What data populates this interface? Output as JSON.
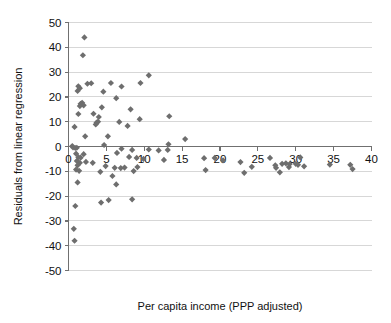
{
  "chart_data": {
    "type": "scatter",
    "title": "",
    "xlabel": "Per capita income (PPP adjusted)",
    "ylabel": "Residuals from linear regression",
    "xlim": [
      0,
      40
    ],
    "ylim": [
      -50,
      50
    ],
    "xticks": [
      0,
      5,
      10,
      15,
      20,
      25,
      30,
      35,
      40
    ],
    "xtick_labels": [
      "0",
      "5",
      "10",
      "15",
      "20",
      "25",
      "30",
      "35",
      "40"
    ],
    "yticks": [
      -50,
      -40,
      -30,
      -20,
      -10,
      0,
      10,
      20,
      30,
      40,
      50
    ],
    "ytick_labels": [
      "-50",
      "-40",
      "-30",
      "-20",
      "-10",
      "0",
      "10",
      "20",
      "30",
      "40",
      "50"
    ],
    "grid": "horizontal",
    "zero_line": true,
    "legend": "none",
    "marker": "diamond",
    "marker_color": "#6e6e6e",
    "series": [
      {
        "name": "Residuals",
        "points": [
          [
            2.1,
            44.0
          ],
          [
            1.9,
            36.8
          ],
          [
            10.6,
            28.7
          ],
          [
            9.5,
            25.6
          ],
          [
            1.3,
            24.3
          ],
          [
            1.5,
            23.5
          ],
          [
            1.2,
            22.4
          ],
          [
            2.5,
            25.3
          ],
          [
            3.0,
            25.5
          ],
          [
            5.6,
            25.6
          ],
          [
            7.0,
            24.2
          ],
          [
            4.6,
            22.1
          ],
          [
            6.3,
            19.5
          ],
          [
            1.8,
            17.6
          ],
          [
            1.6,
            17.2
          ],
          [
            2.0,
            16.6
          ],
          [
            1.5,
            16.3
          ],
          [
            4.4,
            15.8
          ],
          [
            8.2,
            15.0
          ],
          [
            1.3,
            13.1
          ],
          [
            3.3,
            13.2
          ],
          [
            13.3,
            12.2
          ],
          [
            4.0,
            11.9
          ],
          [
            9.4,
            11.0
          ],
          [
            3.9,
            10.0
          ],
          [
            6.7,
            9.9
          ],
          [
            3.7,
            9.6
          ],
          [
            3.6,
            8.9
          ],
          [
            0.8,
            7.9
          ],
          [
            7.8,
            8.3
          ],
          [
            15.4,
            3.0
          ],
          [
            2.2,
            4.1
          ],
          [
            5.2,
            4.1
          ],
          [
            4.7,
            0.6
          ],
          [
            13.2,
            0.9
          ],
          [
            0.5,
            0.2
          ],
          [
            0.6,
            -0.4
          ],
          [
            0.9,
            -0.6
          ],
          [
            1.1,
            -0.5
          ],
          [
            7.0,
            -0.9
          ],
          [
            8.4,
            -1.4
          ],
          [
            10.6,
            -1.2
          ],
          [
            11.9,
            -1.6
          ],
          [
            13.1,
            -1.4
          ],
          [
            6.4,
            -2.6
          ],
          [
            1.0,
            -2.9
          ],
          [
            2.0,
            -3.1
          ],
          [
            1.3,
            -4.3
          ],
          [
            1.6,
            -4.5
          ],
          [
            8.0,
            -4.2
          ],
          [
            9.0,
            -4.6
          ],
          [
            9.9,
            -5.0
          ],
          [
            12.6,
            -5.4
          ],
          [
            17.9,
            -4.7
          ],
          [
            19.3,
            -4.6
          ],
          [
            1.1,
            -5.8
          ],
          [
            2.3,
            -6.2
          ],
          [
            1.5,
            -6.6
          ],
          [
            3.2,
            -6.6
          ],
          [
            20.4,
            -5.6
          ],
          [
            22.7,
            -6.3
          ],
          [
            26.6,
            -4.6
          ],
          [
            30.6,
            -4.4
          ],
          [
            1.2,
            -7.6
          ],
          [
            4.9,
            -7.9
          ],
          [
            6.1,
            -8.6
          ],
          [
            6.9,
            -8.7
          ],
          [
            7.4,
            -8.5
          ],
          [
            9.1,
            -8.3
          ],
          [
            27.3,
            -7.6
          ],
          [
            28.2,
            -7.0
          ],
          [
            28.7,
            -6.8
          ],
          [
            29.2,
            -7.1
          ],
          [
            30.0,
            -7.0
          ],
          [
            30.3,
            -7.4
          ],
          [
            34.5,
            -7.3
          ],
          [
            37.2,
            -7.4
          ],
          [
            1.0,
            -9.3
          ],
          [
            1.4,
            -9.8
          ],
          [
            4.2,
            -10.2
          ],
          [
            8.6,
            -9.9
          ],
          [
            18.1,
            -9.5
          ],
          [
            24.2,
            -8.2
          ],
          [
            27.4,
            -8.6
          ],
          [
            29.1,
            -8.3
          ],
          [
            31.1,
            -8.0
          ],
          [
            37.5,
            -9.1
          ],
          [
            5.8,
            -11.9
          ],
          [
            23.2,
            -10.6
          ],
          [
            27.9,
            -10.4
          ],
          [
            1.2,
            -14.5
          ],
          [
            6.3,
            -15.3
          ],
          [
            4.3,
            -22.6
          ],
          [
            5.3,
            -21.6
          ],
          [
            8.4,
            -21.3
          ],
          [
            0.9,
            -24.0
          ],
          [
            0.7,
            -33.2
          ],
          [
            0.8,
            -38.0
          ]
        ]
      }
    ]
  }
}
